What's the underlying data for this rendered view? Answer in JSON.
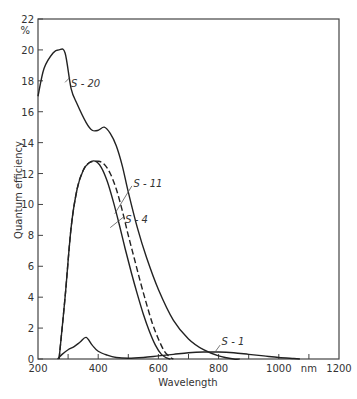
{
  "chart_data": {
    "type": "line",
    "title": "",
    "xlabel": "Wavelength",
    "ylabel": "Quantum efficiency",
    "y_unit": "%",
    "x_unit": "nm",
    "xlim": [
      200,
      1200
    ],
    "ylim": [
      0,
      22
    ],
    "x_ticks": [
      200,
      400,
      600,
      800,
      1000,
      1200
    ],
    "x_tick_labels": [
      "200",
      "400",
      "600",
      "800",
      "1000",
      "nm",
      "1200"
    ],
    "y_ticks": [
      0,
      2,
      4,
      6,
      8,
      10,
      12,
      14,
      16,
      18,
      20,
      22
    ],
    "grid": false,
    "legend": "inline labels",
    "series": [
      {
        "name": "S-20",
        "style": "solid",
        "x": [
          200,
          220,
          250,
          270,
          290,
          310,
          330,
          360,
          380,
          400,
          420,
          440,
          460,
          480,
          500,
          530,
          560,
          600,
          650,
          700,
          750,
          800,
          850,
          870
        ],
        "values": [
          17.0,
          18.8,
          19.8,
          20.0,
          19.8,
          17.5,
          16.5,
          15.3,
          14.8,
          14.8,
          15.0,
          14.6,
          13.8,
          12.5,
          10.8,
          8.5,
          6.6,
          4.5,
          2.5,
          1.3,
          0.6,
          0.2,
          0.0,
          0.0
        ]
      },
      {
        "name": "S-11",
        "style": "dashed",
        "x": [
          270,
          290,
          310,
          330,
          350,
          370,
          400,
          420,
          440,
          460,
          480,
          500,
          520,
          540,
          560,
          580,
          600,
          620,
          640,
          650
        ],
        "values": [
          0.0,
          4.0,
          8.5,
          11.0,
          12.2,
          12.7,
          12.8,
          12.6,
          12.0,
          11.0,
          9.6,
          8.0,
          6.5,
          5.0,
          3.6,
          2.3,
          1.3,
          0.5,
          0.1,
          0.0
        ]
      },
      {
        "name": "S-4",
        "style": "solid",
        "x": [
          270,
          290,
          310,
          330,
          350,
          370,
          390,
          410,
          430,
          450,
          470,
          490,
          510,
          530,
          550,
          570,
          590,
          610,
          630,
          640
        ],
        "values": [
          0.0,
          4.0,
          8.5,
          11.0,
          12.2,
          12.7,
          12.8,
          12.4,
          11.5,
          10.2,
          8.7,
          7.1,
          5.6,
          4.2,
          2.9,
          1.8,
          0.9,
          0.3,
          0.05,
          0.0
        ]
      },
      {
        "name": "S-1",
        "style": "solid",
        "x": [
          265,
          280,
          300,
          320,
          340,
          360,
          380,
          400,
          430,
          460,
          500,
          550,
          600,
          650,
          700,
          750,
          800,
          850,
          900,
          950,
          1000,
          1050,
          1070
        ],
        "values": [
          0.0,
          0.3,
          0.6,
          0.8,
          1.1,
          1.4,
          0.9,
          0.5,
          0.25,
          0.1,
          0.05,
          0.1,
          0.2,
          0.3,
          0.4,
          0.45,
          0.45,
          0.4,
          0.3,
          0.2,
          0.1,
          0.03,
          0.0
        ]
      }
    ],
    "annotations": [
      {
        "text": "S-20",
        "x": 300,
        "y": 17.5
      },
      {
        "text": "S-11",
        "x": 520,
        "y": 11.5
      },
      {
        "text": "S-4",
        "x": 490,
        "y": 9.0
      },
      {
        "text": "S-1",
        "x": 800,
        "y": 0.9
      }
    ]
  }
}
